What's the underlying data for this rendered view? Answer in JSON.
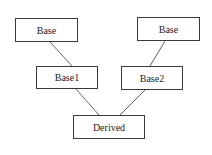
{
  "diagram": {
    "type": "class-inheritance",
    "nodes": [
      {
        "id": "base_left",
        "label": "Base",
        "x": 15,
        "y": 18,
        "w": 63,
        "h": 24
      },
      {
        "id": "base_right",
        "label": "Base",
        "x": 137,
        "y": 17,
        "w": 63,
        "h": 24
      },
      {
        "id": "base1",
        "label": "Base1",
        "x": 36,
        "y": 66,
        "w": 62,
        "h": 23
      },
      {
        "id": "base2",
        "label": "Base2",
        "x": 121,
        "y": 66,
        "w": 62,
        "h": 24
      },
      {
        "id": "derived",
        "label": "Derived",
        "x": 73,
        "y": 115,
        "w": 72,
        "h": 24
      }
    ],
    "edges": [
      {
        "from": "base_left",
        "to": "base1",
        "x1": 50,
        "y1": 42,
        "x2": 72,
        "y2": 66
      },
      {
        "from": "base_right",
        "to": "base2",
        "x1": 165,
        "y1": 41,
        "x2": 150,
        "y2": 66
      },
      {
        "from": "base1",
        "to": "derived",
        "x1": 76,
        "y1": 89,
        "x2": 99,
        "y2": 115
      },
      {
        "from": "base2",
        "to": "derived",
        "x1": 145,
        "y1": 90,
        "x2": 120,
        "y2": 115
      }
    ],
    "colors": {
      "border": "#3a3a3a",
      "line": "#555555",
      "text": "#222222",
      "background": "#ffffff"
    }
  }
}
